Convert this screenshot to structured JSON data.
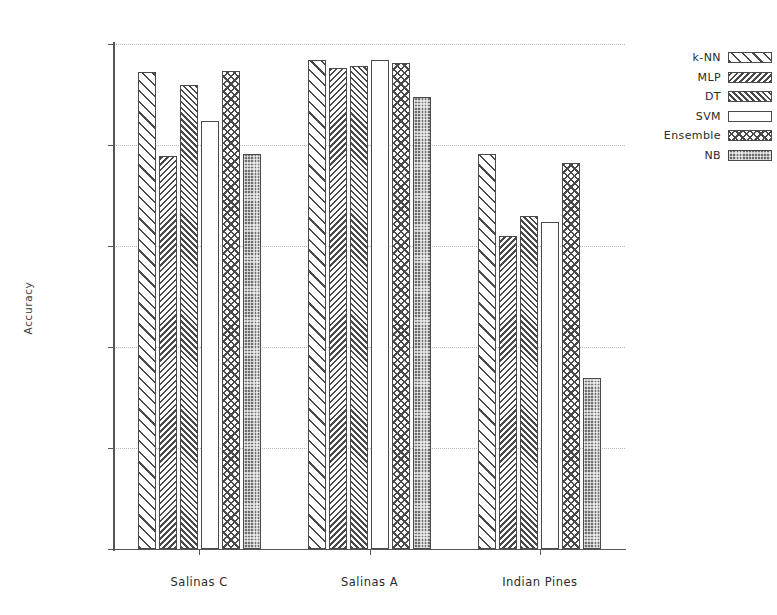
{
  "chart_data": {
    "type": "bar",
    "title": "",
    "xlabel": "",
    "ylabel": "Accuracy",
    "categories": [
      "Salinas C",
      "Salinas A",
      "Indian Pines"
    ],
    "ylim": [
      0,
      100
    ],
    "yticks": [
      0,
      20,
      40,
      60,
      80,
      100
    ],
    "ytick_labels": [
      "0 %",
      "20 %",
      "40 %",
      "60 %",
      "80 %",
      "100 %"
    ],
    "grid": true,
    "grid_axis": "y",
    "grid_style": "dotted",
    "legend_position": "upper right",
    "value_unit": "%",
    "series": [
      {
        "name": "k-NN",
        "pattern": "diagonal-wide-forward",
        "values": [
          94.5,
          96.8,
          78.2
        ]
      },
      {
        "name": "MLP",
        "pattern": "diagonal-dense-back",
        "values": [
          77.8,
          95.2,
          62.0
        ]
      },
      {
        "name": "DT",
        "pattern": "diagonal-dense-forward",
        "values": [
          91.9,
          95.6,
          66.0
        ]
      },
      {
        "name": "SVM",
        "pattern": "blank",
        "values": [
          84.8,
          96.8,
          64.8
        ]
      },
      {
        "name": "Ensemble",
        "pattern": "crosshatch",
        "values": [
          94.6,
          96.2,
          76.5
        ]
      },
      {
        "name": "NB",
        "pattern": "dotted-dark",
        "values": [
          78.2,
          89.5,
          33.9
        ]
      }
    ]
  },
  "legend": {
    "entries": [
      {
        "label": "k-NN"
      },
      {
        "label": "MLP"
      },
      {
        "label": "DT"
      },
      {
        "label": "SVM"
      },
      {
        "label": "Ensemble"
      },
      {
        "label": "NB"
      }
    ]
  },
  "colors": {
    "axis": "#555555",
    "grid": "#b9b9b9",
    "hatch": "#4a4a4a",
    "nb_fill": "#6f6f6f",
    "background": "#ffffff",
    "text": "#2b2b2b"
  }
}
